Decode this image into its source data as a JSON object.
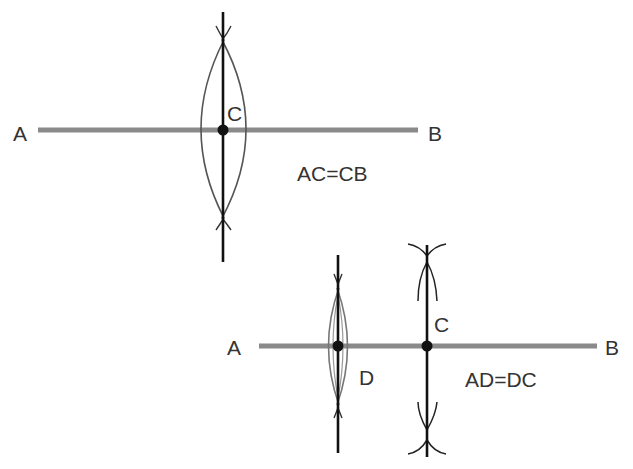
{
  "figure_1": {
    "point_a": "A",
    "point_b": "B",
    "point_c": "C",
    "equation": "AC=CB"
  },
  "figure_2": {
    "point_a": "A",
    "point_b": "B",
    "point_c": "C",
    "point_d": "D",
    "equation": "AD=DC"
  },
  "colors": {
    "segment": "#8a8a8a",
    "bisector": "#111111",
    "arc": "#555555",
    "label": "#333333"
  }
}
